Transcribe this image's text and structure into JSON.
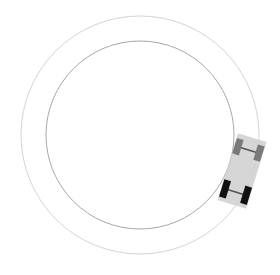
{
  "scene": {
    "width": 280,
    "height": 275,
    "background": "#ffffff"
  },
  "track": {
    "center": [
      140,
      135
    ],
    "outer_boundary": {
      "radius": 119,
      "color": "#d4d4d4",
      "stroke_width": 1
    },
    "inner_boundary": {
      "radius": 94,
      "color": "#a8a8a8",
      "stroke_width": 1
    }
  },
  "car": {
    "center": [
      242,
      171
    ],
    "rotation_deg": 17,
    "body": {
      "width": 30,
      "length": 70,
      "color": "#cfcfcf",
      "opacity": 0.85
    },
    "front_wheels": {
      "color": "#7a7a7a",
      "width": 7,
      "length": 16,
      "offset_y": -22,
      "offset_x": 11
    },
    "rear_wheels": {
      "color": "#111111",
      "width": 7,
      "length": 18,
      "offset_y": 22,
      "offset_x": 11
    },
    "axle_color": "#555555"
  }
}
